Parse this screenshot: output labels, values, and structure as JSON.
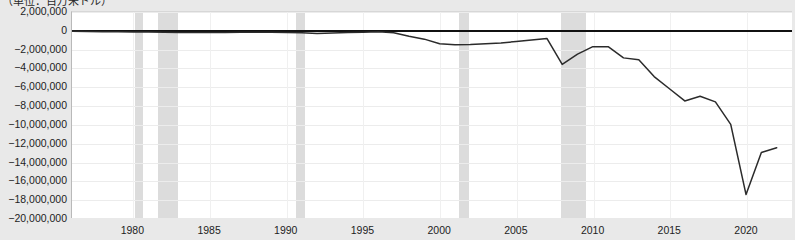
{
  "caption": {
    "unit_note": "（単位：百万米ドル）"
  },
  "axes": {
    "y_ticks": [
      "2,000,000",
      "0",
      "−2,000,000",
      "−4,000,000",
      "−6,000,000",
      "−8,000,000",
      "−10,000,000",
      "−12,000,000",
      "−14,000,000",
      "−16,000,000",
      "−18,000,000",
      "−20,000,000"
    ],
    "x_ticks": [
      "1980",
      "1985",
      "1990",
      "1995",
      "2000",
      "2005",
      "2010",
      "2015",
      "2020"
    ]
  },
  "colors": {
    "line": "#2b2b2b",
    "zero_rule": "#111111",
    "recession_band": "#dcdcdc",
    "plot_background": "#ffffff",
    "page_background": "#e9e9e9",
    "gridline": "#ececec"
  },
  "chart_data": {
    "type": "line",
    "title": "",
    "subtitle": "",
    "xlabel": "",
    "ylabel": "（単位：百万米ドル）",
    "xlim": [
      1976,
      2023
    ],
    "ylim": [
      -20000000,
      2000000
    ],
    "ytick_values": [
      2000000,
      0,
      -2000000,
      -4000000,
      -6000000,
      -8000000,
      -10000000,
      -12000000,
      -14000000,
      -16000000,
      -18000000,
      -20000000
    ],
    "xtick_values": [
      1980,
      1985,
      1990,
      1995,
      2000,
      2005,
      2010,
      2015,
      2020
    ],
    "grid": true,
    "legend": "none",
    "series": [
      {
        "name": "",
        "x": [
          1976,
          1977,
          1978,
          1979,
          1980,
          1981,
          1982,
          1983,
          1984,
          1985,
          1986,
          1987,
          1988,
          1989,
          1990,
          1991,
          1992,
          1993,
          1994,
          1995,
          1996,
          1997,
          1998,
          1999,
          2000,
          2001,
          2002,
          2003,
          2004,
          2005,
          2006,
          2007,
          2008,
          2009,
          2010,
          2011,
          2012,
          2013,
          2014,
          2015,
          2016,
          2017,
          2018,
          2019,
          2020,
          2021,
          2022
        ],
        "y": [
          -60000,
          -80000,
          -100000,
          -120000,
          -140000,
          -130000,
          -160000,
          -200000,
          -190000,
          -180000,
          -200000,
          -170000,
          -160000,
          -150000,
          -190000,
          -220000,
          -290000,
          -250000,
          -200000,
          -170000,
          -110000,
          -220000,
          -600000,
          -900000,
          -1400000,
          -1500000,
          -1480000,
          -1400000,
          -1300000,
          -1150000,
          -1000000,
          -820000,
          -3600000,
          -2500000,
          -1700000,
          -1700000,
          -2900000,
          -3100000,
          -4900000,
          -6200000,
          -7500000,
          -7000000,
          -7600000,
          -10000000,
          -17500000,
          -13000000,
          -12500000
        ]
      }
    ],
    "shaded_regions": [
      {
        "name": "recession-1980",
        "start": 1980.1,
        "end": 1980.6
      },
      {
        "name": "recession-1981-1982",
        "start": 1981.6,
        "end": 1982.9
      },
      {
        "name": "recession-1990-1991",
        "start": 1990.6,
        "end": 1991.2
      },
      {
        "name": "recession-2001",
        "start": 2001.2,
        "end": 2001.9
      },
      {
        "name": "recession-2008-2009",
        "start": 2007.9,
        "end": 2009.5
      }
    ]
  }
}
